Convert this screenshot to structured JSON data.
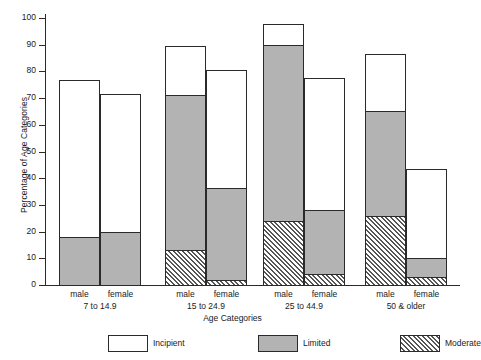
{
  "chart_data": {
    "type": "bar",
    "title": "",
    "subtitle": "",
    "xlabel": "Age Categories",
    "ylabel": "Percentage of Age Categories",
    "ylim": [
      0,
      100
    ],
    "ytick_labels": [
      "0",
      "10",
      "20",
      "30",
      "40",
      "50",
      "60",
      "70",
      "80",
      "90",
      "100"
    ],
    "yticks": [
      0,
      10,
      20,
      30,
      40,
      50,
      60,
      70,
      80,
      90,
      100
    ],
    "grid": false,
    "stacked": true,
    "legend_position": "bottom",
    "legend": [
      "Incipient",
      "Limited",
      "Moderate"
    ],
    "series": [
      {
        "name": "Moderate",
        "fill": "diagonal-hatch",
        "values": [
          0,
          0,
          13,
          2,
          24,
          4,
          26,
          3
        ]
      },
      {
        "name": "Limited",
        "fill": "solid-gray",
        "values": [
          18,
          20,
          58,
          34.5,
          66,
          24,
          39,
          7
        ]
      },
      {
        "name": "Incipient",
        "fill": "white",
        "values": [
          59,
          52,
          19,
          44.5,
          8,
          50,
          22,
          34
        ]
      }
    ],
    "cumulative_tops": {
      "moderate": [
        0,
        0,
        13,
        2,
        24,
        4,
        26,
        3
      ],
      "limited": [
        18,
        20,
        71,
        36.5,
        90,
        28,
        65,
        10
      ],
      "total": [
        77,
        72,
        90,
        81,
        98,
        78,
        87,
        44
      ]
    },
    "categories": [
      "male 7 to 14.9",
      "female 7 to 14.9",
      "male 15 to 24.9",
      "female 15 to 24.9",
      "male 25 to 44.9",
      "female 25 to 44.9",
      "male 50 & older",
      "female 50 & older"
    ],
    "groups": [
      {
        "label": "7 to 14.9",
        "bars": [
          {
            "label": "male",
            "moderate": 0,
            "limited": 18,
            "total": 77
          },
          {
            "label": "female",
            "moderate": 0,
            "limited": 20,
            "total": 72
          }
        ]
      },
      {
        "label": "15 to 24.9",
        "bars": [
          {
            "label": "male",
            "moderate": 13,
            "limited": 71,
            "total": 90
          },
          {
            "label": "female",
            "moderate": 2,
            "limited": 36.5,
            "total": 81
          }
        ]
      },
      {
        "label": "25 to 44.9",
        "bars": [
          {
            "label": "male",
            "moderate": 24,
            "limited": 90,
            "total": 98
          },
          {
            "label": "female",
            "moderate": 4,
            "limited": 28,
            "total": 78
          }
        ]
      },
      {
        "label": "50 & older",
        "bars": [
          {
            "label": "male",
            "moderate": 26,
            "limited": 65,
            "total": 87
          },
          {
            "label": "female",
            "moderate": 3,
            "limited": 10,
            "total": 44
          }
        ]
      }
    ]
  },
  "colors": {
    "axis": "#2a2a2a",
    "limited": "#b3b3b3",
    "incipient": "#ffffff",
    "moderate_hatch": "#555555",
    "background": "#ffffff"
  }
}
